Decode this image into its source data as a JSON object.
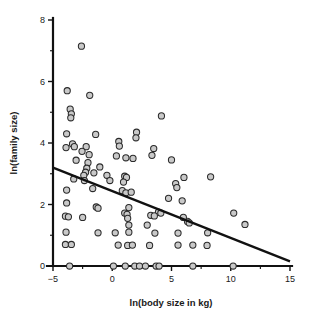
{
  "chart_data": {
    "type": "scatter",
    "title": "",
    "xlabel": "ln(body size in kg)",
    "ylabel": "ln(family size)",
    "xlim": [
      -5,
      15
    ],
    "ylim": [
      0,
      8
    ],
    "xticks": [
      -5,
      0,
      5,
      10,
      15
    ],
    "xtick_labels": [
      "−5",
      "0",
      "5",
      "10",
      "15"
    ],
    "yticks": [
      0,
      2,
      4,
      6,
      8
    ],
    "ytick_labels": [
      "0",
      "2",
      "4",
      "6",
      "8"
    ],
    "x_minor_ticks": [
      -2.5,
      2.5,
      7.5,
      12.5
    ],
    "y_minor_ticks": [
      1,
      3,
      5,
      7
    ],
    "grid": false,
    "legend": "none",
    "marker": {
      "shape": "circle",
      "fill_color": "#c9c9c9",
      "edge_color": "#2a2a2a",
      "radius_px": 3.1
    },
    "trendline": {
      "type": "linear-regression",
      "color": "#111111",
      "x_start": -5,
      "y_start": 3.2,
      "x_end": 15,
      "y_end": 0.15
    },
    "points": [
      [
        -2.6,
        7.15
      ],
      [
        -3.8,
        5.7
      ],
      [
        -1.9,
        5.55
      ],
      [
        -3.55,
        5.1
      ],
      [
        -3.45,
        4.95
      ],
      [
        -3.5,
        4.82
      ],
      [
        4.15,
        4.88
      ],
      [
        -3.85,
        4.3
      ],
      [
        -1.4,
        4.28
      ],
      [
        2.05,
        4.35
      ],
      [
        2.0,
        4.17
      ],
      [
        -3.9,
        3.85
      ],
      [
        -3.35,
        3.97
      ],
      [
        -3.2,
        3.88
      ],
      [
        -2.2,
        3.88
      ],
      [
        0.55,
        4.05
      ],
      [
        0.6,
        3.9
      ],
      [
        3.5,
        3.82
      ],
      [
        -2.55,
        3.73
      ],
      [
        -1.95,
        3.62
      ],
      [
        3.35,
        3.6
      ],
      [
        0.35,
        3.58
      ],
      [
        1.15,
        3.52
      ],
      [
        1.75,
        3.5
      ],
      [
        5.0,
        3.45
      ],
      [
        -3.05,
        3.44
      ],
      [
        -2.05,
        3.36
      ],
      [
        -2.15,
        3.18
      ],
      [
        -1.05,
        3.22
      ],
      [
        -2.25,
        3.05
      ],
      [
        -1.55,
        3.03
      ],
      [
        -3.25,
        2.83
      ],
      [
        -2.4,
        2.95
      ],
      [
        -2.35,
        2.78
      ],
      [
        -0.45,
        2.95
      ],
      [
        1.05,
        2.92
      ],
      [
        1.2,
        2.88
      ],
      [
        0.95,
        2.73
      ],
      [
        -0.2,
        2.78
      ],
      [
        6.05,
        2.88
      ],
      [
        8.3,
        2.9
      ],
      [
        5.35,
        2.68
      ],
      [
        5.45,
        2.55
      ],
      [
        -1.65,
        2.52
      ],
      [
        -3.85,
        2.47
      ],
      [
        0.85,
        2.45
      ],
      [
        1.15,
        2.38
      ],
      [
        1.6,
        2.4
      ],
      [
        4.75,
        2.2
      ],
      [
        5.9,
        2.12
      ],
      [
        -3.85,
        2.05
      ],
      [
        -1.35,
        1.92
      ],
      [
        -1.2,
        1.88
      ],
      [
        1.4,
        1.9
      ],
      [
        3.9,
        1.75
      ],
      [
        4.1,
        1.72
      ],
      [
        -3.95,
        1.62
      ],
      [
        -3.7,
        1.6
      ],
      [
        -2.5,
        1.58
      ],
      [
        1.05,
        1.72
      ],
      [
        1.25,
        1.68
      ],
      [
        1.3,
        1.55
      ],
      [
        3.25,
        1.65
      ],
      [
        3.55,
        1.63
      ],
      [
        6.35,
        1.45
      ],
      [
        6.5,
        1.4
      ],
      [
        6.0,
        1.58
      ],
      [
        10.25,
        1.72
      ],
      [
        11.2,
        1.35
      ],
      [
        1.4,
        1.33
      ],
      [
        2.95,
        1.33
      ],
      [
        -3.9,
        1.1
      ],
      [
        -1.2,
        1.08
      ],
      [
        0.25,
        1.08
      ],
      [
        1.4,
        1.1
      ],
      [
        3.6,
        1.07
      ],
      [
        5.55,
        1.07
      ],
      [
        8.05,
        1.08
      ],
      [
        -3.95,
        0.7
      ],
      [
        -3.45,
        0.7
      ],
      [
        0.5,
        0.68
      ],
      [
        1.3,
        0.67
      ],
      [
        1.7,
        0.68
      ],
      [
        3.15,
        0.67
      ],
      [
        5.55,
        0.68
      ],
      [
        6.8,
        0.68
      ],
      [
        8.0,
        0.67
      ],
      [
        -3.6,
        0.0
      ],
      [
        0.1,
        0.0
      ],
      [
        1.1,
        0.0
      ],
      [
        1.9,
        0.0
      ],
      [
        2.3,
        0.0
      ],
      [
        2.8,
        0.0
      ],
      [
        3.7,
        0.0
      ],
      [
        3.95,
        0.0
      ],
      [
        6.8,
        0.0
      ],
      [
        10.2,
        0.0
      ]
    ]
  }
}
